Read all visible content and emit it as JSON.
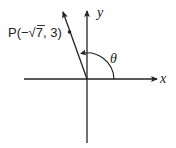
{
  "diagram": {
    "type": "angle-in-standard-position",
    "axes": {
      "x_label": "x",
      "y_label": "y"
    },
    "point": {
      "label_prefix": "P(",
      "label_minus": "−",
      "label_sqrt": "√",
      "label_radicand": "7",
      "label_suffix": ", 3)",
      "coordinates": {
        "x": "-√7",
        "y": "3"
      }
    },
    "angle": {
      "label": "θ",
      "quadrant": "II"
    },
    "colors": {
      "stroke": "#222222",
      "background": "#ffffff"
    }
  }
}
